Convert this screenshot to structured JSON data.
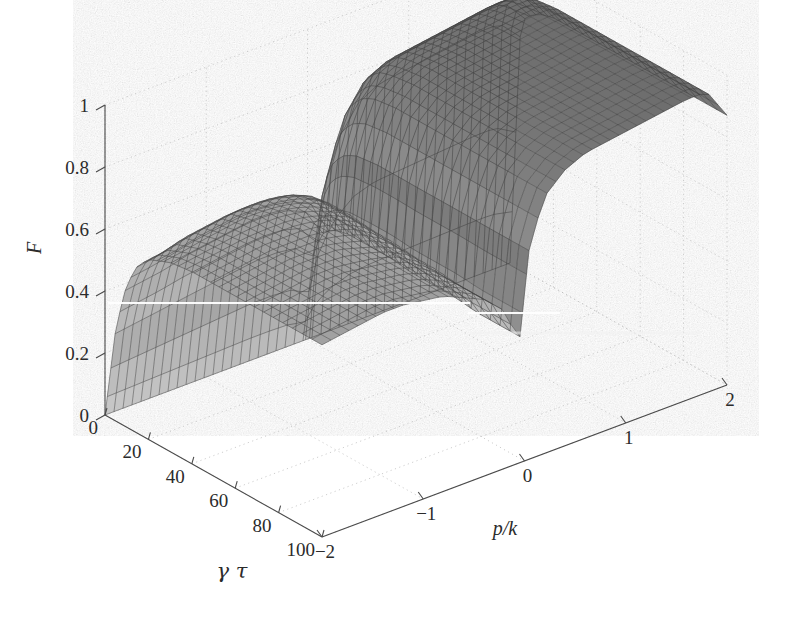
{
  "figure": {
    "background_color": "#ffffff",
    "ink_color": "#2b2b2b",
    "grid_color": "#c8c8c8"
  },
  "chart_data": {
    "type": "surface",
    "title": "",
    "xlabel": "p/k",
    "ylabel": "γ τ",
    "zlabel": "F",
    "xlim": [
      -2,
      2
    ],
    "ylim": [
      0,
      100
    ],
    "zlim": [
      0,
      1
    ],
    "xticks": [
      -2,
      -1,
      0,
      1,
      2
    ],
    "xticklabels": [
      "−2",
      "−1",
      "0",
      "1",
      "2"
    ],
    "yticks": [
      0,
      20,
      40,
      60,
      80,
      100
    ],
    "yticklabels": [
      "0",
      "20",
      "40",
      "60",
      "80",
      "100"
    ],
    "zticks": [
      0,
      0.2,
      0.4,
      0.6,
      0.8,
      1
    ],
    "zticklabels": [
      "0",
      "0.2",
      "0.4",
      "0.6",
      "0.8",
      "1"
    ],
    "grid": true,
    "legend": false,
    "colormap": "gray",
    "mesh_style": "wireframe-shaded",
    "view": {
      "azimuth": -37.5,
      "elevation": 24
    },
    "x": [
      -2,
      -1.8,
      -1.6,
      -1.4,
      -1.2,
      -1,
      -0.8,
      -0.6,
      -0.4,
      -0.2,
      -0.05,
      0.05,
      0.2,
      0.4,
      0.6,
      0.8,
      1,
      1.2,
      1.4,
      1.6,
      1.8,
      2
    ],
    "y": [
      0,
      5,
      10,
      15,
      20,
      30,
      40,
      50,
      60,
      70,
      80,
      90,
      100
    ],
    "z": [
      [
        0,
        0,
        0,
        0,
        0,
        0,
        0,
        0,
        0,
        0,
        0,
        0,
        0,
        0,
        0,
        0,
        0,
        0,
        0,
        0,
        0,
        0
      ],
      [
        0.3,
        0.31,
        0.32,
        0.33,
        0.34,
        0.35,
        0.36,
        0.37,
        0.37,
        0.36,
        0.3,
        0.52,
        0.68,
        0.78,
        0.82,
        0.83,
        0.84,
        0.85,
        0.86,
        0.87,
        0.87,
        0.8
      ],
      [
        0.46,
        0.47,
        0.48,
        0.5,
        0.51,
        0.52,
        0.53,
        0.53,
        0.52,
        0.49,
        0.38,
        0.62,
        0.76,
        0.84,
        0.87,
        0.88,
        0.89,
        0.9,
        0.91,
        0.92,
        0.92,
        0.84
      ],
      [
        0.54,
        0.55,
        0.57,
        0.58,
        0.59,
        0.6,
        0.6,
        0.59,
        0.57,
        0.53,
        0.4,
        0.66,
        0.8,
        0.87,
        0.9,
        0.91,
        0.92,
        0.93,
        0.94,
        0.95,
        0.95,
        0.86
      ],
      [
        0.58,
        0.59,
        0.61,
        0.62,
        0.63,
        0.63,
        0.63,
        0.62,
        0.59,
        0.54,
        0.41,
        0.68,
        0.82,
        0.88,
        0.91,
        0.92,
        0.93,
        0.94,
        0.95,
        0.96,
        0.96,
        0.87
      ],
      [
        0.61,
        0.62,
        0.63,
        0.64,
        0.65,
        0.65,
        0.64,
        0.62,
        0.59,
        0.54,
        0.41,
        0.69,
        0.83,
        0.89,
        0.92,
        0.93,
        0.94,
        0.95,
        0.96,
        0.97,
        0.97,
        0.87
      ],
      [
        0.62,
        0.63,
        0.64,
        0.65,
        0.65,
        0.65,
        0.64,
        0.62,
        0.59,
        0.53,
        0.41,
        0.69,
        0.83,
        0.89,
        0.92,
        0.93,
        0.94,
        0.95,
        0.96,
        0.97,
        0.97,
        0.87
      ],
      [
        0.62,
        0.63,
        0.64,
        0.65,
        0.65,
        0.65,
        0.64,
        0.62,
        0.58,
        0.53,
        0.4,
        0.69,
        0.83,
        0.89,
        0.92,
        0.93,
        0.94,
        0.95,
        0.96,
        0.97,
        0.97,
        0.87
      ],
      [
        0.62,
        0.63,
        0.64,
        0.65,
        0.65,
        0.65,
        0.63,
        0.61,
        0.58,
        0.52,
        0.4,
        0.69,
        0.83,
        0.89,
        0.92,
        0.93,
        0.94,
        0.95,
        0.96,
        0.97,
        0.97,
        0.87
      ],
      [
        0.62,
        0.63,
        0.64,
        0.65,
        0.65,
        0.64,
        0.63,
        0.61,
        0.57,
        0.52,
        0.4,
        0.69,
        0.83,
        0.89,
        0.92,
        0.93,
        0.94,
        0.95,
        0.96,
        0.97,
        0.97,
        0.87
      ],
      [
        0.62,
        0.63,
        0.64,
        0.65,
        0.65,
        0.64,
        0.63,
        0.61,
        0.57,
        0.51,
        0.39,
        0.69,
        0.83,
        0.89,
        0.92,
        0.93,
        0.94,
        0.95,
        0.96,
        0.97,
        0.97,
        0.87
      ],
      [
        0.62,
        0.63,
        0.64,
        0.65,
        0.65,
        0.64,
        0.63,
        0.6,
        0.57,
        0.51,
        0.39,
        0.69,
        0.83,
        0.89,
        0.92,
        0.93,
        0.94,
        0.95,
        0.96,
        0.97,
        0.97,
        0.87
      ],
      [
        0.62,
        0.63,
        0.64,
        0.65,
        0.65,
        0.64,
        0.63,
        0.6,
        0.57,
        0.51,
        0.39,
        0.69,
        0.83,
        0.89,
        0.92,
        0.93,
        0.94,
        0.95,
        0.96,
        0.97,
        0.97,
        0.87
      ]
    ]
  },
  "axes": {
    "z_axis": {
      "name": "F",
      "ticks": [
        "0",
        "0.2",
        "0.4",
        "0.6",
        "0.8",
        "1"
      ]
    },
    "y_axis": {
      "name": "γ τ",
      "ticks": [
        "0",
        "20",
        "40",
        "60",
        "80",
        "100"
      ]
    },
    "x_axis": {
      "name": "p/k",
      "ticks": [
        "−2",
        "−1",
        "0",
        "1",
        "2"
      ]
    }
  }
}
